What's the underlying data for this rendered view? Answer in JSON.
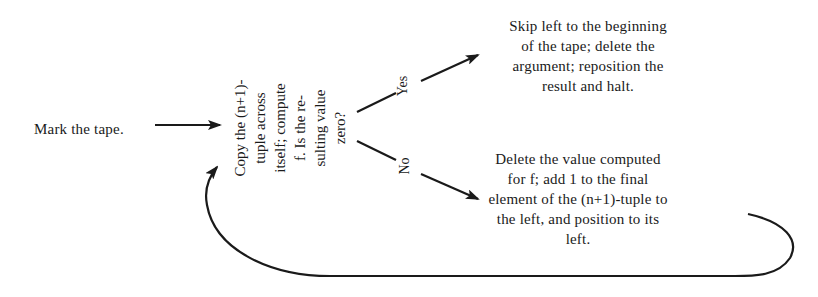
{
  "diagram": {
    "type": "flowchart",
    "colors": {
      "background": "#ffffff",
      "ink": "#1a1a1a"
    },
    "nodes": {
      "start": {
        "lines": [
          "Mark the tape."
        ]
      },
      "decision": {
        "orientation": "rotated-90-ccw",
        "lines": [
          "Copy the (n+1)-",
          "tuple across",
          "itself; compute",
          "f. Is the re-",
          "sulting value",
          "zero?"
        ]
      },
      "halt": {
        "lines": [
          "Skip left to the beginning",
          "of the tape; delete the",
          "argument; reposition the",
          "result and halt."
        ]
      },
      "loop": {
        "lines": [
          "Delete the value computed",
          "for f; add 1 to the final",
          "element of the (n+1)-tuple to",
          "the left, and position to its",
          "left."
        ]
      }
    },
    "edges": [
      {
        "from": "start",
        "to": "decision",
        "label": ""
      },
      {
        "from": "decision",
        "to": "halt",
        "label": "Yes"
      },
      {
        "from": "decision",
        "to": "loop",
        "label": "No"
      },
      {
        "from": "loop",
        "to": "decision",
        "label": ""
      }
    ],
    "labels": {
      "yes": "Yes",
      "no": "No"
    }
  }
}
